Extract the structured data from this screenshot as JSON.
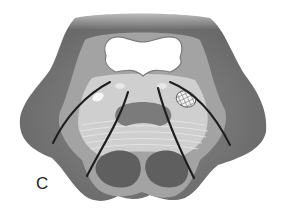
{
  "figure": {
    "panel_label": "C",
    "colors": {
      "outer_tissue": "#6e6e6e",
      "mid_tissue": "#9a9a9a",
      "light_tissue": "#d4d4d4",
      "cavity": "#ffffff",
      "lobes": "#5e5e5e",
      "incision": "#1e1e1e"
    }
  }
}
